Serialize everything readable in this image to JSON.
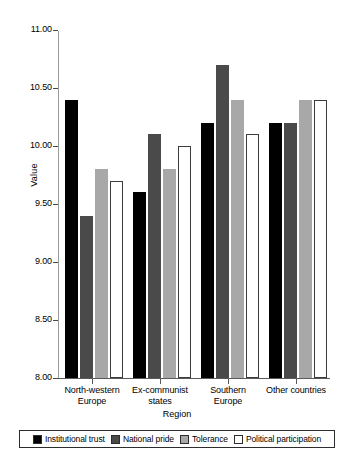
{
  "chart_data": {
    "type": "bar",
    "title": "",
    "xlabel": "Region",
    "ylabel": "Value",
    "ylim": [
      8.0,
      11.0
    ],
    "ytick_labels": [
      "11.00",
      "10.50",
      "10.00",
      "9.50",
      "9.00",
      "8.50",
      "8.00"
    ],
    "ytick_values": [
      11.0,
      10.5,
      10.0,
      9.5,
      9.0,
      8.5,
      8.0
    ],
    "grid": false,
    "legend_position": "bottom",
    "categories": [
      "North-western\nEurope",
      "Ex-communist\nstates",
      "Southern\nEurope",
      "Other countries"
    ],
    "series": [
      {
        "name": "Institutional trust",
        "color": "#000000",
        "values": [
          10.4,
          9.6,
          10.2,
          10.2
        ]
      },
      {
        "name": "National pride",
        "color": "#4a4a4a",
        "values": [
          9.4,
          10.1,
          10.7,
          10.2
        ]
      },
      {
        "name": "Tolerance",
        "color": "#a8a8a8",
        "values": [
          9.8,
          9.8,
          10.4,
          10.4
        ]
      },
      {
        "name": "Political participation",
        "color": "#ffffff",
        "values": [
          9.7,
          10.0,
          10.1,
          10.4
        ]
      }
    ]
  }
}
